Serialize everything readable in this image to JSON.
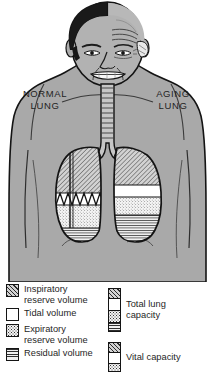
{
  "labels": {
    "left": "NORMAL\nLUNG",
    "right": "AGING\nLUNG"
  },
  "colors": {
    "skin_gray": "#a9a9a9",
    "skin_gray_light": "#b6b6b6",
    "outline": "#141414",
    "lung_fill_white": "#ffffff",
    "hatch_fill": "#d2d2d2",
    "stipple_fill": "#f2f2f2",
    "lines_fill": "#efefef",
    "hair_dark": "#171717",
    "background": "#ffffff"
  },
  "legend": {
    "left_column": [
      {
        "label": "Inspiratory\nreserve volume",
        "pattern": "diagonal-hatch",
        "swatch": "pat-hatch"
      },
      {
        "label": "Tidal volume",
        "pattern": "white",
        "swatch": "pat-white"
      },
      {
        "label": "Expiratory\nreserve volume",
        "pattern": "stipple",
        "swatch": "pat-stipple"
      },
      {
        "label": "Residual volume",
        "pattern": "horizontal-lines",
        "swatch": "pat-lines"
      }
    ],
    "right_column": [
      {
        "label": "Total lung\ncapacity",
        "segments": [
          "diagonal-hatch",
          "white",
          "stipple",
          "horizontal-lines"
        ]
      },
      {
        "label": "Vital capacity",
        "segments": [
          "diagonal-hatch",
          "white",
          "stipple"
        ]
      }
    ]
  },
  "lungs": {
    "normal": {
      "name": "normal-lung",
      "side": "viewer-left",
      "bands": [
        {
          "name": "inspiratory-reserve-volume",
          "pattern": "diagonal-hatch",
          "top": 150,
          "bottom": 193
        },
        {
          "name": "tidal-volume",
          "pattern": "white-with-sawtooth-trace",
          "top": 193,
          "bottom": 205
        },
        {
          "name": "expiratory-reserve-volume",
          "pattern": "stipple",
          "top": 205,
          "bottom": 228
        },
        {
          "name": "residual-volume",
          "pattern": "horizontal-lines",
          "top": 228,
          "bottom": 241
        }
      ],
      "annotations": [
        "tidal-breathing-sawtooth-trace",
        "vertical-measurement-line"
      ]
    },
    "aging": {
      "name": "aging-lung",
      "side": "viewer-right",
      "bands": [
        {
          "name": "inspiratory-reserve-volume",
          "pattern": "diagonal-hatch",
          "top": 155,
          "bottom": 185
        },
        {
          "name": "tidal-volume",
          "pattern": "white",
          "top": 185,
          "bottom": 197
        },
        {
          "name": "expiratory-reserve-volume",
          "pattern": "stipple",
          "top": 197,
          "bottom": 215
        },
        {
          "name": "residual-volume",
          "pattern": "horizontal-lines",
          "top": 215,
          "bottom": 241
        }
      ],
      "annotations": []
    }
  },
  "head": {
    "left_half": "young-full-dark-hair",
    "right_half": "aged-bald-with-forehead-wrinkles"
  },
  "anatomy": {
    "trachea": "cartilage-ringed-airway",
    "bronchi": "left-and-right-main-bronchi"
  }
}
